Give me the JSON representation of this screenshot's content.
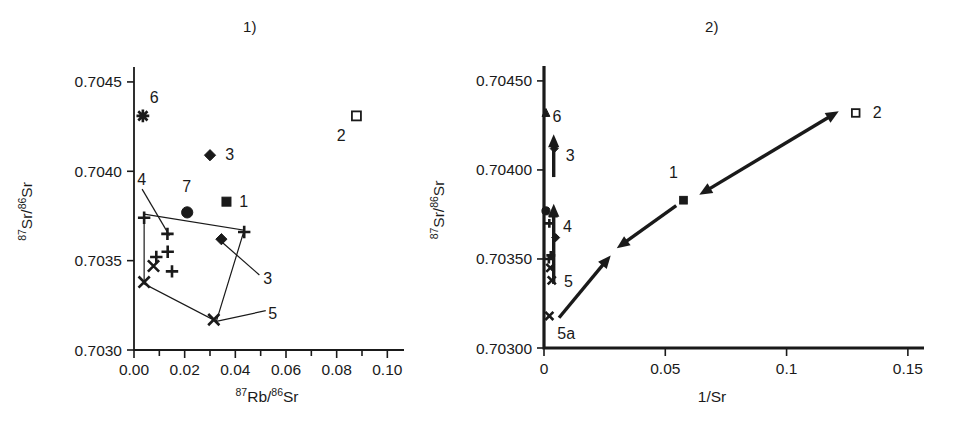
{
  "figure": {
    "panels": [
      {
        "title": "1)",
        "xlabel_pre": "87",
        "xlabel_mid": "Rb/",
        "xlabel_sup2": "86",
        "xlabel_end": "Sr",
        "ylabel_pre": "87",
        "ylabel_mid": "Sr/",
        "ylabel_sup2": "86",
        "ylabel_end": "Sr"
      },
      {
        "title": "2)",
        "xlabel": "1/Sr",
        "ylabel_pre": "87",
        "ylabel_mid": "Sr/",
        "ylabel_sup2": "86",
        "ylabel_end": "Sr"
      }
    ]
  },
  "chart_data": [
    {
      "type": "scatter",
      "title": "1)",
      "xlabel": "87Rb/86Sr",
      "ylabel": "87Sr/86Sr",
      "xlim": [
        0.0,
        0.105
      ],
      "ylim": [
        0.703,
        0.70455
      ],
      "xticks": [
        0.0,
        0.01,
        0.02,
        0.03,
        0.04,
        0.05,
        0.06,
        0.07,
        0.08,
        0.09,
        0.1
      ],
      "xtick_labels": [
        "0.00",
        "",
        "0.02",
        "",
        "0.04",
        "",
        "0.06",
        "",
        "0.08",
        "",
        "0.10"
      ],
      "yticks": [
        0.703,
        0.7035,
        0.704,
        0.7045
      ],
      "ytick_labels": [
        "0.7030",
        "0.7035",
        "0.7040",
        "0.7045"
      ],
      "grid": false,
      "legend": "none",
      "series": [
        {
          "name": "1",
          "marker": "filled-square",
          "label": "1",
          "points": [
            {
              "x": 0.0365,
              "y": 0.70383
            }
          ]
        },
        {
          "name": "2",
          "marker": "open-square",
          "label": "2",
          "points": [
            {
              "x": 0.0878,
              "y": 0.70431
            }
          ]
        },
        {
          "name": "3",
          "marker": "filled-diamond",
          "label": "3",
          "points": [
            {
              "x": 0.03,
              "y": 0.70409
            },
            {
              "x": 0.0345,
              "y": 0.70362
            }
          ]
        },
        {
          "name": "4",
          "marker": "plus",
          "label": "4",
          "points": [
            {
              "x": 0.004,
              "y": 0.70374
            },
            {
              "x": 0.0132,
              "y": 0.70365
            },
            {
              "x": 0.0133,
              "y": 0.70355
            },
            {
              "x": 0.0088,
              "y": 0.70352
            },
            {
              "x": 0.015,
              "y": 0.70344
            },
            {
              "x": 0.0435,
              "y": 0.70366
            }
          ]
        },
        {
          "name": "5",
          "marker": "x-cross",
          "label": "5",
          "points": [
            {
              "x": 0.0077,
              "y": 0.70347
            },
            {
              "x": 0.004,
              "y": 0.70338
            },
            {
              "x": 0.0315,
              "y": 0.70317
            }
          ]
        },
        {
          "name": "6",
          "marker": "star",
          "label": "6",
          "points": [
            {
              "x": 0.0035,
              "y": 0.70431
            }
          ]
        },
        {
          "name": "7",
          "marker": "filled-circle",
          "label": "7",
          "points": [
            {
              "x": 0.021,
              "y": 0.70377
            }
          ]
        }
      ],
      "hull": [
        {
          "x": 0.004,
          "y": 0.70376
        },
        {
          "x": 0.0435,
          "y": 0.70367
        },
        {
          "x": 0.0325,
          "y": 0.70316
        },
        {
          "x": 0.004,
          "y": 0.70337
        }
      ],
      "annotations": [
        {
          "text": "1",
          "x": 0.0415,
          "y": 0.70383
        },
        {
          "text": "2",
          "x": 0.08,
          "y": 0.7042
        },
        {
          "text": "3",
          "x": 0.036,
          "y": 0.70409
        },
        {
          "text": "3",
          "x": 0.051,
          "y": 0.7034
        },
        {
          "text": "4",
          "x": 0.0013,
          "y": 0.70395
        },
        {
          "text": "5",
          "x": 0.053,
          "y": 0.7032
        },
        {
          "text": "6",
          "x": 0.0062,
          "y": 0.70441
        },
        {
          "text": "7",
          "x": 0.019,
          "y": 0.70391
        }
      ]
    },
    {
      "type": "scatter",
      "title": "2)",
      "xlabel": "1/Sr",
      "ylabel": "87Sr/86Sr",
      "xlim": [
        0.0,
        0.155
      ],
      "ylim": [
        0.703,
        0.70455
      ],
      "xticks": [
        0.0,
        0.05,
        0.1,
        0.15
      ],
      "xtick_labels": [
        "0",
        "0.05",
        "0.1",
        "0.15"
      ],
      "yticks": [
        0.703,
        0.7035,
        0.704,
        0.7045
      ],
      "ytick_labels": [
        "0.70300",
        "0.70350",
        "0.70400",
        "0.70450"
      ],
      "grid": false,
      "legend": "none",
      "series": [
        {
          "name": "1",
          "marker": "filled-square",
          "label": "1",
          "points": [
            {
              "x": 0.0575,
              "y": 0.70383
            }
          ]
        },
        {
          "name": "2",
          "marker": "open-square",
          "label": "2",
          "points": [
            {
              "x": 0.1285,
              "y": 0.70432
            }
          ]
        },
        {
          "name": "3",
          "marker": "filled-diamond",
          "label": "3",
          "points": [
            {
              "x": 0.0042,
              "y": 0.70412
            },
            {
              "x": 0.0048,
              "y": 0.70362
            }
          ]
        },
        {
          "name": "4",
          "marker": "plus",
          "label": "4",
          "points": [
            {
              "x": 0.0038,
              "y": 0.70374
            },
            {
              "x": 0.0022,
              "y": 0.7037
            },
            {
              "x": 0.0028,
              "y": 0.70352
            },
            {
              "x": 0.002,
              "y": 0.7035
            }
          ]
        },
        {
          "name": "5",
          "marker": "x-cross",
          "label": "5",
          "points": [
            {
              "x": 0.0026,
              "y": 0.70345
            },
            {
              "x": 0.0032,
              "y": 0.70338
            }
          ]
        },
        {
          "name": "5a",
          "marker": "x-cross",
          "label": "5a",
          "points": [
            {
              "x": 0.0022,
              "y": 0.70318
            }
          ]
        },
        {
          "name": "6",
          "marker": "filled-triangle",
          "label": "6",
          "points": [
            {
              "x": 0.0008,
              "y": 0.70432
            }
          ]
        },
        {
          "name": "7",
          "marker": "filled-circle",
          "label": "7",
          "points": [
            {
              "x": 0.0008,
              "y": 0.70377
            }
          ]
        }
      ],
      "vectors": [
        {
          "name": "mixing-arrow-1-to-2",
          "x1": 0.064,
          "y1": 0.70386,
          "x2": 0.1215,
          "y2": 0.70433,
          "head": "both"
        },
        {
          "name": "mixing-arrow-1-down",
          "x1": 0.0545,
          "y1": 0.7038,
          "x2": 0.03,
          "y2": 0.70356,
          "head": "end"
        },
        {
          "name": "mixing-arrow-lower",
          "x1": 0.0062,
          "y1": 0.70317,
          "x2": 0.0275,
          "y2": 0.70352,
          "head": "end"
        },
        {
          "name": "vertical-arrow-upper",
          "x1": 0.004,
          "y1": 0.70396,
          "x2": 0.004,
          "y2": 0.7042,
          "head": "end"
        },
        {
          "name": "vertical-arrow-lower",
          "x1": 0.004,
          "y1": 0.70336,
          "x2": 0.004,
          "y2": 0.70381,
          "head": "end"
        }
      ],
      "annotations": [
        {
          "text": "1",
          "x": 0.0515,
          "y": 0.70398
        },
        {
          "text": "2",
          "x": 0.1355,
          "y": 0.70432
        },
        {
          "text": "3",
          "x": 0.009,
          "y": 0.70408
        },
        {
          "text": "4",
          "x": 0.0078,
          "y": 0.70368
        },
        {
          "text": "5",
          "x": 0.0082,
          "y": 0.70337
        },
        {
          "text": "5a",
          "x": 0.0055,
          "y": 0.70308
        },
        {
          "text": "6",
          "x": 0.0035,
          "y": 0.7043
        }
      ]
    }
  ]
}
